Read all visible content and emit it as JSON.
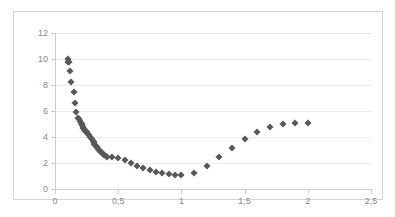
{
  "chart_data": {
    "type": "scatter",
    "title": "",
    "xlabel": "",
    "ylabel": "",
    "xlim": [
      0,
      2.5
    ],
    "ylim": [
      0,
      12
    ],
    "grid": true,
    "legend": false,
    "marker_color": "#585858",
    "marker_shape": "diamond",
    "axis_label_color": "#8a8a8a",
    "gridline_color": "#e9eced",
    "border_color": "#d6d6d6",
    "decimal_separator": ",",
    "xticks": [
      0,
      0.5,
      1,
      1.5,
      2,
      2.5
    ],
    "xtick_labels": [
      "0",
      "0,5",
      "1",
      "1,5",
      "2",
      "2,5"
    ],
    "yticks": [
      0,
      2,
      4,
      6,
      8,
      10,
      12
    ],
    "ytick_labels": [
      "0",
      "2",
      "4",
      "6",
      "8",
      "10",
      "12"
    ],
    "x": [
      0.1,
      0.1,
      0.11,
      0.12,
      0.13,
      0.15,
      0.16,
      0.17,
      0.18,
      0.19,
      0.2,
      0.205,
      0.21,
      0.215,
      0.22,
      0.225,
      0.23,
      0.24,
      0.25,
      0.26,
      0.27,
      0.28,
      0.29,
      0.3,
      0.305,
      0.31,
      0.32,
      0.325,
      0.33,
      0.34,
      0.35,
      0.355,
      0.36,
      0.37,
      0.38,
      0.39,
      0.4,
      0.41,
      0.45,
      0.5,
      0.55,
      0.6,
      0.65,
      0.7,
      0.75,
      0.8,
      0.85,
      0.9,
      0.95,
      1.0,
      1.1,
      1.2,
      1.3,
      1.4,
      1.5,
      1.6,
      1.7,
      1.8,
      1.9,
      2.0
    ],
    "y": [
      10.0,
      9.8,
      9.75,
      9.1,
      8.25,
      7.45,
      6.6,
      5.95,
      5.5,
      5.35,
      5.2,
      5.1,
      5.0,
      4.9,
      4.8,
      4.7,
      4.6,
      4.5,
      4.4,
      4.2,
      4.15,
      4.0,
      3.85,
      3.7,
      3.6,
      3.5,
      3.4,
      3.3,
      3.2,
      3.1,
      3.0,
      2.92,
      2.85,
      2.78,
      2.7,
      2.62,
      2.55,
      2.5,
      2.45,
      2.35,
      2.25,
      2.0,
      1.8,
      1.6,
      1.45,
      1.3,
      1.2,
      1.12,
      1.1,
      1.1,
      1.25,
      1.8,
      2.45,
      3.15,
      3.85,
      4.35,
      4.75,
      5.0,
      5.05,
      5.05
    ]
  }
}
